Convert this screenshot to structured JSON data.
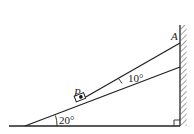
{
  "diagram": {
    "labels": {
      "point_p": "P",
      "point_a": "A",
      "incline_angle": "20°",
      "rope_angle": "10°"
    },
    "colors": {
      "stroke": "#222222",
      "background": "#ffffff"
    }
  }
}
